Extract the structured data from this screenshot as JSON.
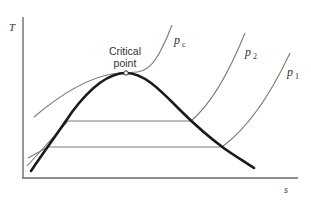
{
  "diagram": {
    "type": "T-s diagram (temperature-entropy) with saturation dome and isobars",
    "axes": {
      "y_label": "T",
      "x_label": "s"
    },
    "annotations": {
      "critical_point_line1": "Critical",
      "critical_point_line2": "point"
    },
    "isobars": [
      {
        "name": "p_c",
        "base": "p",
        "subscript": "c"
      },
      {
        "name": "p_2",
        "base": "p",
        "subscript": "2"
      },
      {
        "name": "p_1",
        "base": "p",
        "subscript": "1"
      }
    ],
    "colors": {
      "dome": "#1a1a1a",
      "isobar": "#7a7a7a",
      "axis": "#6a6a6a",
      "text": "#333333"
    }
  }
}
